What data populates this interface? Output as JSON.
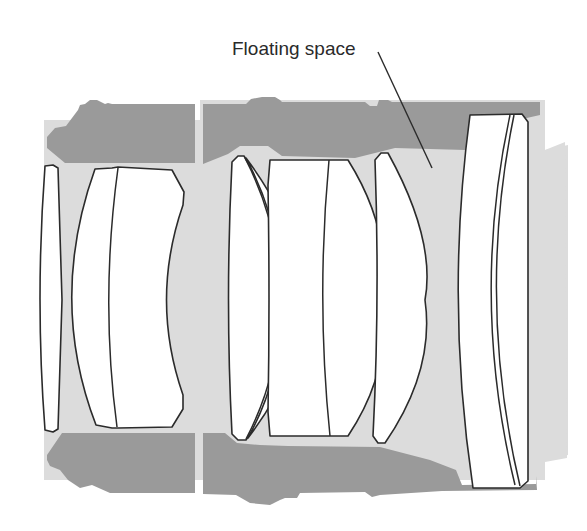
{
  "diagram": {
    "annotation": {
      "label": "Floating space",
      "target": "air gap between third lens group and rear element"
    },
    "colors": {
      "barrel": "#9a9a9a",
      "optical_space": "#dcdcdc",
      "lens_glass": "#ffffff",
      "outline": "#2b2b2b",
      "background": "#ffffff"
    },
    "elements": [
      {
        "id": "front-element",
        "type": "lens"
      },
      {
        "id": "front-cemented-doublet",
        "type": "lens-group"
      },
      {
        "id": "middle-meniscus-pair",
        "type": "lens-group"
      },
      {
        "id": "middle-cemented-doublet",
        "type": "lens-group"
      },
      {
        "id": "floating-element",
        "type": "lens"
      },
      {
        "id": "rear-cemented-group",
        "type": "lens-group"
      }
    ]
  }
}
